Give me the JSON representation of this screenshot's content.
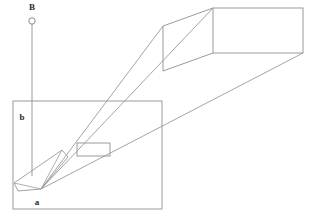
{
  "diagram": {
    "type": "optical-projection-geometry",
    "background_color": "#ffffff",
    "line_color": "#8f8f8f",
    "line_color_dark": "#6e6e6e",
    "label_color": "#2b2b2b",
    "canvas": {
      "width": 314,
      "height": 219
    },
    "labels": {
      "point_b": "B",
      "point_a": "a",
      "region_b": "b"
    },
    "source_marker": {
      "name": "source-circle",
      "cx": 32,
      "cy": 21,
      "r": 3.2
    },
    "label_positions": {
      "point_b": {
        "x": 32,
        "y": 10
      },
      "point_a": {
        "x": 37,
        "y": 205
      },
      "region_b": {
        "x": 22,
        "y": 120
      }
    },
    "vertical_axis": {
      "name": "vertical-drop-line",
      "x1": 32,
      "y1": 24,
      "x2": 32,
      "y2": 176
    },
    "bounding_box": {
      "name": "enclosure-rect",
      "x": 13,
      "y": 101,
      "width": 149,
      "height": 108
    },
    "far_box": {
      "name": "projection-box",
      "front_face": {
        "x": 213,
        "y": 8,
        "width": 90,
        "height": 45
      },
      "top_back_edge": {
        "x1": 213,
        "y1": 8,
        "x2": 163,
        "y2": 26
      },
      "bottom_back_edge": {
        "x1": 213,
        "y1": 53,
        "x2": 163,
        "y2": 71
      },
      "back_vertical_edge": {
        "x1": 163,
        "y1": 26,
        "x2": 163,
        "y2": 71
      }
    },
    "aperture_rect": {
      "name": "aperture-rect",
      "x": 77,
      "y": 143,
      "width": 33,
      "height": 13
    },
    "convergence_point": {
      "x": 41,
      "y": 189
    },
    "rays": [
      {
        "name": "ray-upper",
        "x1": 41,
        "y1": 189,
        "x2": 213,
        "y2": 8
      },
      {
        "name": "ray-middle",
        "x1": 41,
        "y1": 189,
        "x2": 163,
        "y2": 26
      },
      {
        "name": "ray-lower",
        "x1": 41,
        "y1": 189,
        "x2": 303,
        "y2": 53
      }
    ],
    "lens_body": {
      "name": "lens-barrel",
      "points": "41,189 68,157 62,150 14,183 18,191 41,189"
    },
    "lens_inner_lines": [
      {
        "name": "lens-edge-a",
        "x1": 41,
        "y1": 189,
        "x2": 62,
        "y2": 150
      },
      {
        "name": "lens-edge-b",
        "x1": 41,
        "y1": 189,
        "x2": 14,
        "y2": 183
      }
    ]
  }
}
